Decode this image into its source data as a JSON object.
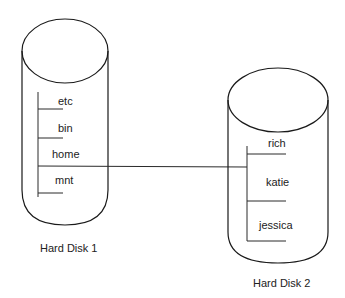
{
  "diagram": {
    "type": "filesystem-mount",
    "connector": {
      "from": "home",
      "to": "Hard Disk 2 root",
      "description": "home directory on Hard Disk 1 mounted to Hard Disk 2"
    },
    "disks": [
      {
        "label": "Hard Disk 1",
        "directories": [
          "etc",
          "bin",
          "home",
          "mnt"
        ]
      },
      {
        "label": "Hard Disk 2",
        "directories": [
          "rich",
          "katie",
          "jessica"
        ]
      }
    ],
    "colors": {
      "line": "#1a1a1a",
      "text": "#222222",
      "background": "#ffffff"
    }
  }
}
